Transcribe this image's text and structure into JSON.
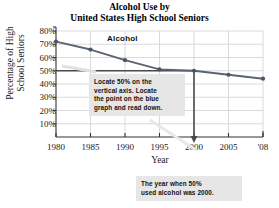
{
  "chart_data": {
    "type": "line",
    "title": "Alcohol Use by United States High School Seniors",
    "title_line1": "Alcohol Use by",
    "title_line2": "United States High School Seniors",
    "xlabel": "Year",
    "ylabel": "Percentage of High School Seniors",
    "ylabel_line1": "Percentage of High",
    "ylabel_line2": "School Seniors",
    "series_label": "Alcohol",
    "x": [
      1980,
      1985,
      1990,
      1995,
      2000,
      2005,
      2008
    ],
    "xtick_labels": [
      "1980",
      "1985",
      "1990",
      "1995",
      "2000",
      "2005",
      "'08"
    ],
    "values": [
      72,
      66,
      58,
      51,
      50,
      47,
      44
    ],
    "ytick_labels": [
      "80%",
      "70%",
      "60%",
      "50%",
      "40%",
      "30%",
      "20%",
      "10%"
    ],
    "ytick_values": [
      80,
      70,
      60,
      50,
      40,
      30,
      20,
      10
    ],
    "ylim": [
      0,
      80
    ],
    "grid": true,
    "legend_position": "inline",
    "line_color": "#5a6472",
    "marker_color": "#4b5563",
    "grid_color": "#d0d0d0",
    "axis_color": "#333333",
    "annotation_color": "#e6e6e6",
    "guide_value": 50,
    "guide_year": 2000,
    "annotations": [
      {
        "name": "locate-instruction",
        "lines": [
          "Locate 50% on the",
          "vertical axis. Locate",
          "the point on the blue",
          "graph and read down."
        ]
      },
      {
        "name": "answer-callout",
        "lines": [
          "The year when 50%",
          "used alcohol was 2000."
        ]
      }
    ]
  }
}
